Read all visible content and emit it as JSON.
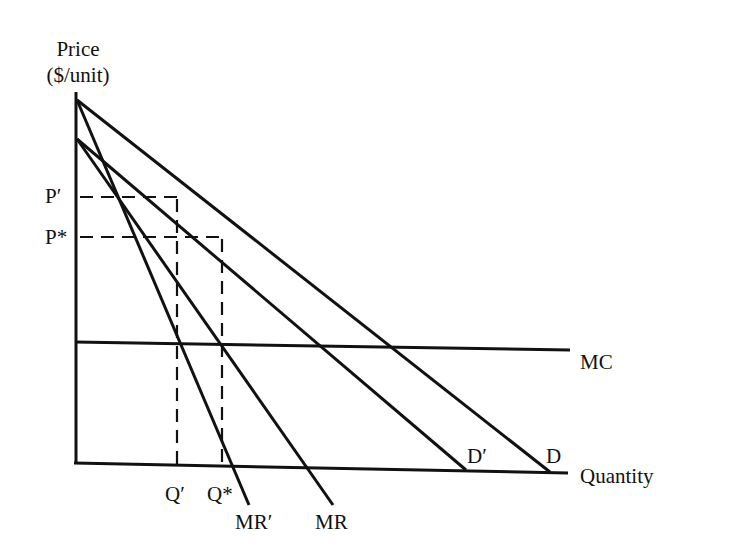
{
  "diagram": {
    "type": "monopoly price/quantity diagram",
    "y_axis": {
      "label_line1": "Price",
      "label_line2": "($/unit)"
    },
    "x_axis": {
      "label": "Quantity"
    },
    "price_labels": {
      "p_prime": "P′",
      "p_star": "P*"
    },
    "quantity_labels": {
      "q_prime": "Q′",
      "q_star": "Q*"
    },
    "curve_labels": {
      "mc": "MC",
      "d_prime": "D′",
      "d": "D",
      "mr_prime": "MR′",
      "mr": "MR"
    },
    "colors": {
      "line": "#111111",
      "background": "#ffffff"
    }
  },
  "geometry": {
    "origin": [
      75,
      463
    ],
    "y_axis_top": [
      77,
      92
    ],
    "x_axis_end": [
      568,
      473
    ],
    "curves": {
      "D": {
        "from": [
          77,
          100
        ],
        "to": [
          550,
          472
        ]
      },
      "D_prime": {
        "from": [
          77,
          139
        ],
        "to": [
          466,
          470
        ]
      },
      "MR": {
        "from": [
          77,
          139
        ],
        "to": [
          333,
          505
        ]
      },
      "MR_prime": {
        "from": [
          77,
          100
        ],
        "to": [
          249,
          505
        ]
      },
      "MC": {
        "from": [
          75,
          342
        ],
        "to": [
          570,
          350
        ]
      }
    },
    "dashed": {
      "p_prime_h": {
        "from": [
          77,
          197
        ],
        "to": [
          180,
          197
        ]
      },
      "p_star_h": {
        "from": [
          77,
          237
        ],
        "to": [
          223,
          237
        ]
      },
      "q_prime_v": {
        "from": [
          177,
          197
        ],
        "to": [
          177,
          465
        ]
      },
      "q_star_v": {
        "from": [
          222,
          237
        ],
        "to": [
          222,
          466
        ]
      }
    }
  }
}
